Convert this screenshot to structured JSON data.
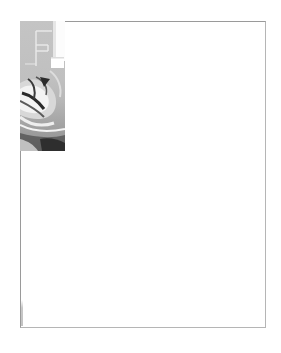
{
  "page": {
    "type": "blank-letterhead-template",
    "background": "#ffffff",
    "frame_color": "#9a9a9a"
  },
  "banner": {
    "description": "grayscale decorative photo banner with abstract white outline shapes and swirl graphic",
    "icon": "abstract-swirl-image",
    "colors": {
      "base": "#c2c2c2",
      "shadow": "#2e2e2e",
      "highlight": "#ffffff"
    }
  },
  "footer": {
    "vertical_text": ""
  }
}
